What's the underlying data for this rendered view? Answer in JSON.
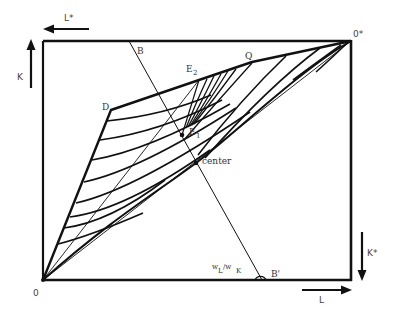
{
  "colors": {
    "ink": "#111111",
    "label": "#333333",
    "background": "#ffffff"
  },
  "axes": {
    "origin_label": "0",
    "origin_star_label": "0*",
    "L_label": "L",
    "K_label": "K",
    "L_star_label": "L*",
    "K_star_label": "K*"
  },
  "points": {
    "B": "B",
    "B_prime": "B'",
    "D": "D",
    "E1": {
      "main": "E",
      "sub": "1"
    },
    "E2": {
      "main": "E",
      "sub": "2"
    },
    "Q": "Q",
    "center": "center"
  },
  "price_ratio": {
    "w1": "w",
    "sub1": "L",
    "slash": "/w",
    "sub2": "K"
  },
  "curves": {
    "contract_curve_upper": "O-D-E2-Q-O*",
    "diagonal": "O-O*",
    "isocost_line": "B-B'",
    "left_isoquant_count": 8,
    "fan_line_count": 7
  }
}
